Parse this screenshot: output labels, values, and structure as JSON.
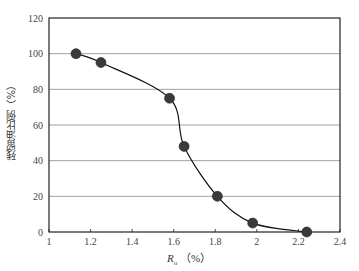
{
  "chart_data": {
    "type": "line",
    "title": "",
    "xlabel": "Ro (%)",
    "ylabel": "残留油比例（%）",
    "xlim": [
      1,
      2.4
    ],
    "ylim": [
      0,
      120
    ],
    "x_ticks": [
      "1",
      "1.2",
      "1.4",
      "1.6",
      "1.8",
      "2",
      "2.2",
      "2.4"
    ],
    "y_ticks": [
      "0",
      "20",
      "40",
      "60",
      "80",
      "100",
      "120"
    ],
    "grid": "horizontal",
    "legend": "none",
    "series": [
      {
        "name": "残留油比例",
        "x": [
          1.13,
          1.25,
          1.58,
          1.65,
          1.81,
          1.98,
          2.24
        ],
        "y": [
          100,
          95,
          75,
          48,
          20,
          5,
          0
        ],
        "marker": "circle",
        "line": "smooth"
      }
    ]
  },
  "labels": {
    "y_axis": "残留油比例（%）",
    "x_axis_symbol": "R",
    "x_axis_subscript": "o",
    "x_axis_unit": "（%）"
  },
  "colors": {
    "marker": "#3a3a3a",
    "line": "#111111",
    "grid": "#888888",
    "axis": "#222222"
  }
}
